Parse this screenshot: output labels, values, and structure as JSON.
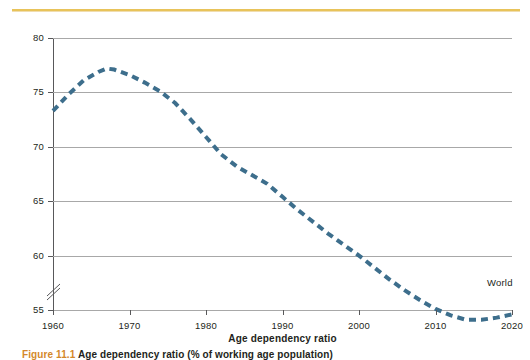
{
  "figure": {
    "caption_number": "Figure 11.1",
    "caption_text": "Age dependency ratio (% of working age population)",
    "series_annotation": "World"
  },
  "colors": {
    "series": "#3d6e8c",
    "top_rule": "#e8c35a",
    "gridline": "#a8a8a8",
    "axis": "#58585a",
    "text": "#231f20",
    "caption_accent": "#d4882a"
  },
  "chart_data": {
    "type": "line",
    "title": "",
    "xlabel": "Age dependency ratio",
    "ylabel": "Percent",
    "xlim": [
      1960,
      2020
    ],
    "ylim": [
      55,
      80
    ],
    "y_axis_break_below": 55,
    "grid": "horizontal",
    "legend_position": "inline-end-of-line",
    "line_style": "dashed",
    "line_width_px": 4,
    "xticks": [
      1960,
      1970,
      1980,
      1990,
      2000,
      2010,
      2020
    ],
    "yticks": [
      55,
      60,
      65,
      70,
      75,
      80
    ],
    "series": [
      {
        "name": "World",
        "x": [
          1960,
          1962,
          1964,
          1966,
          1967,
          1968,
          1970,
          1972,
          1974,
          1976,
          1978,
          1980,
          1982,
          1984,
          1986,
          1988,
          1990,
          1992,
          1994,
          1996,
          1998,
          2000,
          2002,
          2004,
          2006,
          2008,
          2010,
          2012,
          2014,
          2016,
          2018,
          2020
        ],
        "values": [
          73.3,
          74.8,
          76.1,
          76.9,
          77.2,
          77.1,
          76.6,
          75.9,
          75.1,
          74.0,
          72.5,
          70.9,
          69.3,
          68.2,
          67.4,
          66.6,
          65.4,
          64.2,
          63.1,
          62.0,
          61.0,
          60.0,
          58.9,
          57.8,
          56.8,
          55.9,
          55.1,
          54.5,
          54.1,
          54.1,
          54.3,
          54.6
        ]
      }
    ]
  }
}
